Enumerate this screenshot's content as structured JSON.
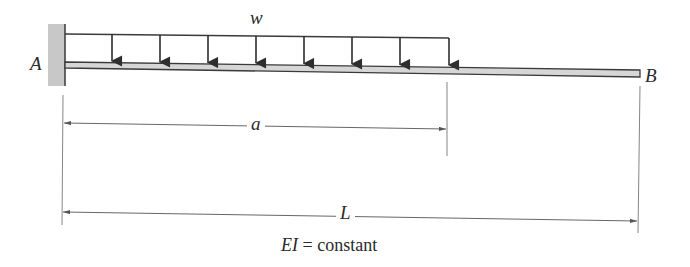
{
  "diagram": {
    "type": "cantilever-beam",
    "labels": {
      "fixed_end": "A",
      "free_end": "B",
      "load": "w",
      "load_length": "a",
      "beam_length": "L",
      "property_ei": "EI",
      "property_eq": " = constant"
    },
    "colors": {
      "line": "#3a3a3a",
      "support_fill": "#c8c8c8",
      "beam_fill": "#d6d6d6",
      "dim_line": "#555555"
    },
    "load": {
      "kind": "uniformly-distributed",
      "arrow_count": 8
    }
  }
}
